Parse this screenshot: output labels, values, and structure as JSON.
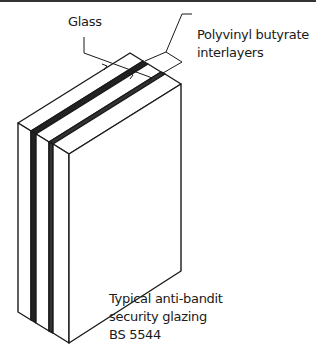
{
  "figure": {
    "title_lines": [
      "Typical anti-bandit",
      "security glazing",
      "BS 5544"
    ],
    "labels": {
      "glass": "Glass",
      "interlayers_line1": "Polyvinyl butyrate",
      "interlayers_line2": "interlayers"
    },
    "components": [
      {
        "name": "glass-pane",
        "count": 3
      },
      {
        "name": "polyvinyl-butyrate-interlayer",
        "count": 2
      }
    ],
    "colors": {
      "line": "#1a1a1a",
      "background": "#ffffff",
      "interlayer": "#222222"
    }
  }
}
